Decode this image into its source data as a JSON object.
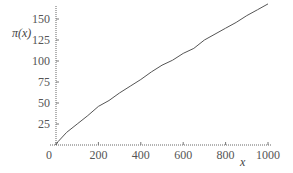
{
  "chart_data": {
    "type": "line",
    "title": "",
    "xlabel": "x",
    "ylabel": "π(x)",
    "xlim": [
      0,
      1000
    ],
    "ylim": [
      0,
      170
    ],
    "x_ticks": [
      "0",
      "200",
      "400",
      "600",
      "800",
      "1000"
    ],
    "y_ticks": [
      "25",
      "50",
      "75",
      "100",
      "125",
      "150"
    ],
    "grid": false,
    "series": [
      {
        "name": "π(x)",
        "x": [
          0,
          2,
          10,
          50,
          100,
          150,
          200,
          250,
          300,
          350,
          400,
          450,
          500,
          550,
          600,
          650,
          700,
          750,
          800,
          850,
          900,
          950,
          1000
        ],
        "values": [
          0,
          1,
          4,
          15,
          25,
          35,
          46,
          53,
          62,
          70,
          78,
          87,
          95,
          101,
          109,
          115,
          125,
          132,
          139,
          146,
          154,
          161,
          168
        ]
      }
    ]
  }
}
